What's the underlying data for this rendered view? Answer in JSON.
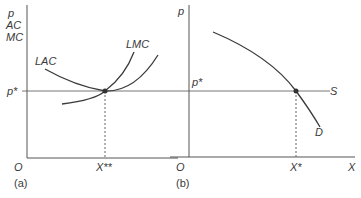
{
  "panel_a": {
    "y_axis_labels": [
      "p",
      "AC",
      "MC"
    ],
    "price_label": "p*",
    "curves": {
      "lac_label": "LAC",
      "lmc_label": "LMC"
    },
    "origin_label": "O",
    "quantity_label": "X**",
    "panel_label": "(a)"
  },
  "panel_b": {
    "y_axis_label": "p",
    "price_label": "p*",
    "supply_label": "S",
    "demand_label": "D",
    "origin_label": "O",
    "quantity_label": "X*",
    "x_axis_label": "X",
    "panel_label": "(b)"
  },
  "colors": {
    "curve": "#3a3a3a",
    "axis": "#555555",
    "background": "#ffffff"
  }
}
